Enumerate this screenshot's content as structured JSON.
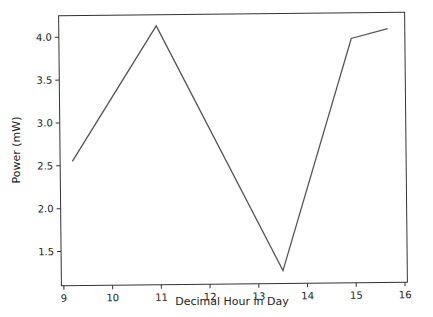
{
  "chart_data": {
    "type": "line",
    "title": "",
    "xlabel": "Decimal Hour in Day",
    "ylabel": "Power (mW)",
    "x": [
      9.2,
      10.95,
      13.5,
      14.95,
      15.7
    ],
    "series": [
      {
        "name": "Power",
        "values": [
          2.55,
          4.12,
          1.25,
          3.95,
          4.06
        ],
        "color": "#555555"
      }
    ],
    "xticks": [
      9,
      10,
      11,
      12,
      13,
      14,
      15,
      16
    ],
    "xtick_labels": [
      "9",
      "10",
      "11",
      "12",
      "13",
      "14",
      "15",
      "16"
    ],
    "yticks": [
      1.5,
      2.0,
      2.5,
      3.0,
      3.5,
      4.0
    ],
    "ytick_labels": [
      "1.5",
      "2.0",
      "2.5",
      "3.0",
      "3.5",
      "4.0"
    ],
    "xlim": [
      8.95,
      16.05
    ],
    "ylim": [
      1.1,
      4.25
    ],
    "grid": false,
    "legend": null
  }
}
